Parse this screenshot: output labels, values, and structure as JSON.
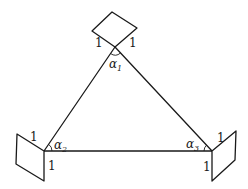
{
  "diagram": {
    "type": "triangle-with-unit-squares",
    "vertices": {
      "top": {
        "angle_symbol": "α",
        "angle_index": "1",
        "side_labels": [
          "1",
          "1"
        ]
      },
      "left": {
        "angle_symbol": "α",
        "angle_index": "2",
        "side_labels": [
          "1",
          "1"
        ]
      },
      "right": {
        "angle_symbol": "α",
        "angle_index": "3",
        "side_labels": [
          "1",
          "1"
        ]
      }
    },
    "colors": {
      "stroke": "#1a1a1a",
      "background": "#ffffff"
    }
  }
}
